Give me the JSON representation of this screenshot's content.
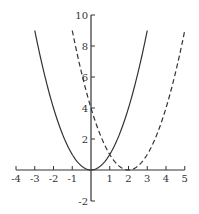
{
  "chart_data": {
    "type": "line",
    "title": "",
    "xlabel": "",
    "ylabel": "",
    "xlim": [
      -4,
      5
    ],
    "ylim": [
      -2,
      10
    ],
    "grid": false,
    "legend": null,
    "x_ticks": [
      -4,
      -3,
      -2,
      -1,
      1,
      2,
      3,
      4,
      5
    ],
    "x_tick_labels": [
      "-4",
      "-3",
      "-2",
      "-1",
      "1",
      "2",
      "3",
      "4",
      "5"
    ],
    "y_ticks": [
      -2,
      2,
      4,
      6,
      8,
      10
    ],
    "y_tick_labels": [
      "-2",
      "2",
      "4",
      "6",
      "8",
      "10"
    ],
    "series": [
      {
        "name": "y = x^2",
        "style": "solid",
        "color": "#333333",
        "x_range": [
          -3,
          3
        ],
        "x": [
          -3,
          -2,
          -1,
          0,
          1,
          2,
          3
        ],
        "y": [
          9,
          4,
          1,
          0,
          1,
          4,
          9
        ]
      },
      {
        "name": "y = (x-2)^2",
        "style": "dashed",
        "color": "#333333",
        "x_range": [
          -1,
          5
        ],
        "x": [
          -1,
          0,
          1,
          2,
          3,
          4,
          5
        ],
        "y": [
          9,
          4,
          1,
          0,
          1,
          4,
          9
        ]
      }
    ]
  },
  "colors": {
    "axis": "#333333",
    "curve": "#333333",
    "background": "#ffffff"
  }
}
